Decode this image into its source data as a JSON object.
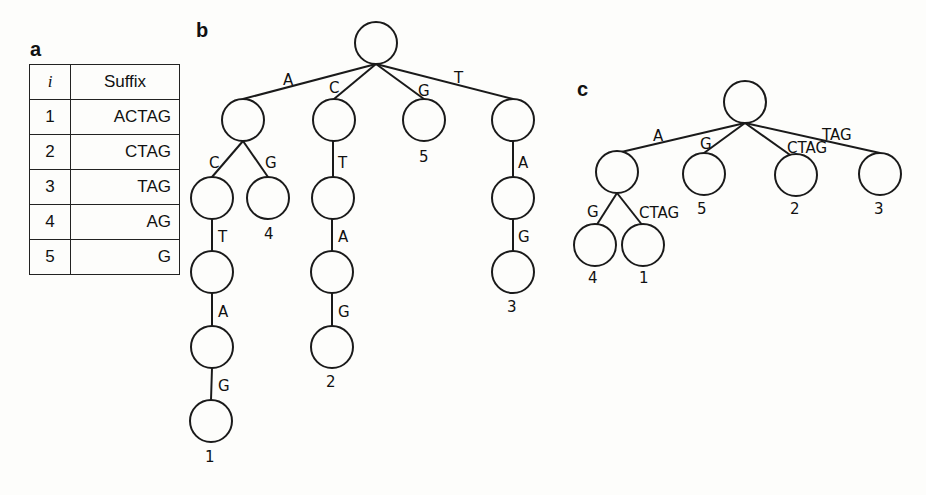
{
  "panels": {
    "a": {
      "label": "a"
    },
    "b": {
      "label": "b"
    },
    "c": {
      "label": "c"
    }
  },
  "suffix_table": {
    "headers": [
      "i",
      "Suffix"
    ],
    "rows": [
      {
        "i": "1",
        "suffix": "ACTAG"
      },
      {
        "i": "2",
        "suffix": "CTAG"
      },
      {
        "i": "3",
        "suffix": "TAG"
      },
      {
        "i": "4",
        "suffix": "AG"
      },
      {
        "i": "5",
        "suffix": "G"
      }
    ]
  },
  "trie_b": {
    "edges": {
      "root_a": "A",
      "root_c": "C",
      "root_g": "G",
      "root_t": "T",
      "a_c": "C",
      "a_g": "G",
      "ac_t": "T",
      "act_a": "A",
      "acta_g": "G",
      "c_t": "T",
      "ct_a": "A",
      "cta_g": "G",
      "t_a": "A",
      "ta_g": "G"
    },
    "leaf_labels": {
      "actag": "1",
      "ctag": "2",
      "tag": "3",
      "ag": "4",
      "g": "5"
    }
  },
  "suffix_tree_c": {
    "edges": {
      "root_a": "A",
      "root_g": "G",
      "root_ctag": "CTAG",
      "root_tag": "TAG",
      "a_g": "G",
      "a_ctag": "CTAG"
    },
    "leaf_labels": {
      "ag": "4",
      "actag": "1",
      "g": "5",
      "ctag": "2",
      "tag": "3"
    }
  }
}
